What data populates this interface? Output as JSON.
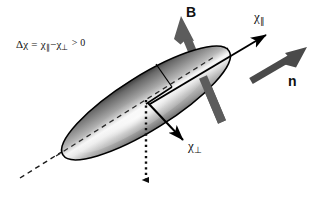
{
  "figure": {
    "background_color": "#ffffff",
    "width": 318,
    "height": 202
  },
  "labels": {
    "formula": {
      "delta": "Δχ",
      "equals": "=",
      "chi_parallel": "χ",
      "parallel_sub": "∥",
      "minus": "−",
      "chi_perp": "χ",
      "perp_sub": "⊥",
      "comparison": "> 0",
      "full_text": "Δχ = χ∥ − χ⊥ > 0"
    },
    "magnetic_field": "B",
    "director": "n",
    "chi_parallel": {
      "symbol": "χ",
      "subscript": "∥"
    },
    "chi_perpendicular": {
      "symbol": "χ",
      "subscript": "⊥"
    }
  },
  "colors": {
    "arrow_thick_gray": "#5c5c5c",
    "arrow_dark_gray": "#4a4a4a",
    "outline_black": "#000000",
    "ellipsoid_dark": "#4e4e4e",
    "ellipsoid_mid": "#8d8d8d",
    "ellipsoid_light": "#f2f2f2",
    "text": "#111111"
  },
  "elements": {
    "ellipsoid": {
      "name": "shaded-ellipsoid",
      "center_x": 146,
      "center_y": 103,
      "semi_major": 98,
      "semi_minor": 27,
      "rotation_deg": -32
    },
    "long_axis_dashed": {
      "name": "long-axis-dashed-line",
      "style": "dashed",
      "x1": 20,
      "y1": 178,
      "x2": 228,
      "y2": 48
    },
    "field_arrow": {
      "name": "magnetic-field-arrow",
      "style": "thick-gray",
      "from_x": 222,
      "from_y": 124,
      "to_x": 178,
      "to_y": 18
    },
    "chi_parallel_arrow": {
      "name": "chi-parallel-arrow",
      "style": "thin-black",
      "from_x": 150,
      "from_y": 104,
      "to_x": 270,
      "to_y": 32
    },
    "director_arrow": {
      "name": "director-arrow",
      "style": "thick-gray",
      "from_x": 252,
      "from_y": 80,
      "to_x": 306,
      "to_y": 48
    },
    "chi_perp_arrow": {
      "name": "chi-perpendicular-arrow",
      "style": "thin-black",
      "from_x": 146,
      "from_y": 104,
      "to_x": 186,
      "to_y": 144
    },
    "vertical_dotted_arrow": {
      "name": "vertical-dotted-arrow",
      "style": "dotted",
      "from_x": 146,
      "from_y": 104,
      "to_x": 146,
      "to_y": 192
    },
    "minor_axis_line": {
      "name": "minor-axis-solid-line",
      "style": "solid-black",
      "x1": 146,
      "y1": 104,
      "x2": 172,
      "y2": 87
    }
  }
}
